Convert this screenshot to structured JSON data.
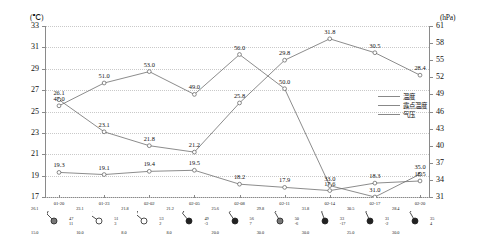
{
  "axes": {
    "left_unit": "(℃)",
    "right_unit": "(hPa)",
    "left_ticks": [
      "33",
      "31",
      "29",
      "27",
      "25",
      "23",
      "21",
      "19",
      "17"
    ],
    "right_ticks": [
      "61",
      "58",
      "55",
      "52",
      "49",
      "46",
      "43",
      "40",
      "37",
      "34",
      "31"
    ],
    "x_ticks": [
      "01-20",
      "01-23",
      "02-02",
      "02-05",
      "02-08",
      "02-11",
      "02-14",
      "02-17",
      "02-20"
    ]
  },
  "legend": {
    "items": [
      {
        "label": "温度",
        "color": "#888888"
      },
      {
        "label": "露点温度",
        "color": "#888888"
      },
      {
        "label": "气压",
        "color": "#888888"
      }
    ]
  },
  "chart_data": {
    "type": "line",
    "title": "",
    "xlabel": "",
    "ylabel": "温度 (℃)",
    "y2label": "气压 (hPa)",
    "grid": true,
    "legend_position": "right",
    "categories": [
      "01-20",
      "01-23",
      "02-02",
      "02-05",
      "02-08",
      "02-11",
      "02-14",
      "02-17",
      "02-20"
    ],
    "ylim": [
      17,
      33
    ],
    "y2lim": [
      31,
      61
    ],
    "series": [
      {
        "name": "气压",
        "axis": "right",
        "unit": "hPa",
        "values": [
          47.0,
          51.0,
          53.0,
          49.0,
          56.0,
          50.0,
          33.0,
          31.0,
          35.0
        ],
        "labels": [
          "47.0",
          "51.0",
          "53.0",
          "49.0",
          "56.0",
          "50.0",
          "33.0",
          "31.0",
          "35.0"
        ]
      },
      {
        "name": "温度",
        "axis": "left",
        "unit": "℃",
        "values": [
          26.1,
          23.1,
          21.8,
          21.2,
          25.8,
          29.8,
          31.8,
          30.5,
          28.4
        ],
        "labels": [
          "26.1",
          "23.1",
          "21.8",
          "21.2",
          "25.8",
          "29.8",
          "31.8",
          "30.5",
          "28.4"
        ]
      },
      {
        "name": "露点温度",
        "axis": "left",
        "unit": "℃",
        "values": [
          19.3,
          19.1,
          19.4,
          19.5,
          18.2,
          17.9,
          17.6,
          18.3,
          18.5
        ],
        "labels": [
          "19.3",
          "19.1",
          "19.4",
          "19.5",
          "18.2",
          "17.9",
          "17.6",
          "18.3",
          "18.5"
        ]
      }
    ]
  },
  "stations": [
    {
      "temp": "26.1",
      "dew": "15.0",
      "p1": "47",
      "p2": "11",
      "wind_deg": 45,
      "cloud": "partly"
    },
    {
      "temp": "23.1",
      "dew": "10.0",
      "p1": "51",
      "p2": "3",
      "wind_deg": 35,
      "cloud": "clear"
    },
    {
      "temp": "21.8",
      "dew": "8.0",
      "p1": "53",
      "p2": "2",
      "wind_deg": 40,
      "cloud": "clear"
    },
    {
      "temp": "21.2",
      "dew": "8.0",
      "p1": "49",
      "p2": "-3",
      "wind_deg": 50,
      "cloud": "full"
    },
    {
      "temp": "25.6",
      "dew": "20.0",
      "p1": "56",
      "p2": "7",
      "wind_deg": 55,
      "cloud": "full"
    },
    {
      "temp": "29.8",
      "dew": "30.0",
      "p1": "50",
      "p2": "-6",
      "wind_deg": 60,
      "cloud": "partly"
    },
    {
      "temp": "31.8",
      "dew": "30.0",
      "p1": "33",
      "p2": "-17",
      "wind_deg": 70,
      "cloud": "full"
    },
    {
      "temp": "30.5",
      "dew": "25.0",
      "p1": "31",
      "p2": "-2",
      "wind_deg": 65,
      "cloud": "full"
    },
    {
      "temp": "28.4",
      "dew": "30.0",
      "p1": "35",
      "p2": "4",
      "wind_deg": 60,
      "cloud": "full"
    }
  ]
}
